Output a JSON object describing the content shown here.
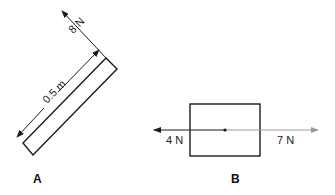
{
  "diagram_a": {
    "label": "A",
    "length_label": "0.5 m",
    "force_label": "8 N",
    "description": "Rod of length 0.5 m at an angle with 8 N force applied perpendicular at its upper end"
  },
  "diagram_b": {
    "label": "B",
    "left_force_label": "4 N",
    "right_force_label": "7 N",
    "description": "Block with opposing horizontal forces of 4 N left and 7 N right acting through center"
  },
  "colors": {
    "outline": "#1a1a1a",
    "dark_arrow": "#1a1a1a",
    "light_arrow": "#9a9a9a",
    "background": "#ffffff"
  }
}
